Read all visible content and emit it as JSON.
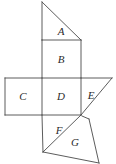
{
  "figure": {
    "kind": "geometry-net-diagram",
    "width": 116,
    "height": 164,
    "background_color": "#ffffff",
    "stroke_color": "#4a4a4a",
    "label_color": "#2b2b2b",
    "faces": [
      {
        "id": "face-a",
        "label": "A",
        "shape": "triangle",
        "points": "42,2 42,40 81,40",
        "label_x": 61,
        "label_y": 32
      },
      {
        "id": "face-b",
        "label": "B",
        "shape": "square",
        "points": "42,40 81,40 81,78 42,78",
        "label_x": 61,
        "label_y": 60
      },
      {
        "id": "face-c",
        "label": "C",
        "shape": "square",
        "points": "5,78 42,78 42,115 5,115",
        "label_x": 23,
        "label_y": 97
      },
      {
        "id": "face-d",
        "label": "D",
        "shape": "square",
        "points": "42,78 81,78 81,115 42,115",
        "label_x": 61,
        "label_y": 97
      },
      {
        "id": "face-e",
        "label": "E",
        "shape": "triangle",
        "points": "81,78 112,78 81,115",
        "label_x": 91,
        "label_y": 96
      },
      {
        "id": "face-f",
        "label": "F",
        "shape": "triangle",
        "points": "42,115 81,115 43,152",
        "label_x": 59,
        "label_y": 131
      },
      {
        "id": "face-g",
        "label": "G",
        "shape": "quadrilateral",
        "points": "81,115 89,119 99,162 43,152",
        "label_x": 75,
        "label_y": 143
      }
    ],
    "edges": [
      {
        "id": "edge-a-left",
        "name": "triangle-a-vertical-edge",
        "d": "M 42,2 L 42,40"
      },
      {
        "id": "edge-a-hyp",
        "name": "triangle-a-hypotenuse",
        "d": "M 42,2 L 81,40"
      },
      {
        "id": "edge-a-base",
        "name": "triangle-a-base",
        "d": "M 42,40 L 81,40"
      },
      {
        "id": "edge-b-right",
        "name": "square-b-right-edge",
        "d": "M 81,40 L 81,78"
      },
      {
        "id": "edge-b-left",
        "name": "square-b-left-edge",
        "d": "M 42,40 L 42,78"
      },
      {
        "id": "edge-row-top",
        "name": "middle-row-top-edge",
        "d": "M 5,78 L 112,78"
      },
      {
        "id": "edge-c-left",
        "name": "square-c-left-edge",
        "d": "M 5,78 L 5,115"
      },
      {
        "id": "edge-c-bottom",
        "name": "square-c-bottom-edge",
        "d": "M 5,115 L 81,115"
      },
      {
        "id": "edge-cd-divider",
        "name": "square-c-d-divider",
        "d": "M 42,78 L 42,115"
      },
      {
        "id": "edge-de-divider",
        "name": "square-d-e-divider",
        "d": "M 81,78 L 81,115"
      },
      {
        "id": "edge-e-hyp",
        "name": "triangle-e-hypotenuse",
        "d": "M 112,78 L 81,115"
      },
      {
        "id": "edge-f-left",
        "name": "triangle-f-left-edge",
        "d": "M 42,115 L 43,152"
      },
      {
        "id": "edge-f-hyp",
        "name": "triangle-f-hypotenuse",
        "d": "M 81,115 L 43,152"
      },
      {
        "id": "edge-g-top",
        "name": "quad-g-top-edge",
        "d": "M 82,116 L 89,119"
      },
      {
        "id": "edge-g-right",
        "name": "quad-g-right-edge",
        "d": "M 89,119 L 99,163"
      },
      {
        "id": "edge-g-bottom",
        "name": "quad-g-bottom-edge",
        "d": "M 43,152 L 99,163"
      }
    ]
  }
}
